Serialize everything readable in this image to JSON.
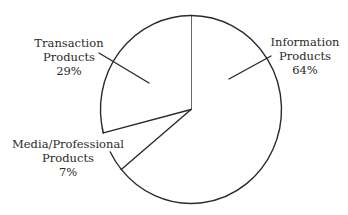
{
  "chart_data": {
    "type": "pie",
    "title": "",
    "slices": [
      {
        "name": "Information Products",
        "label_lines": [
          "Information",
          "Products",
          "64%"
        ],
        "value": 64
      },
      {
        "name": "Media/Professional Products",
        "label_lines": [
          "Media/Professional",
          "Products",
          "7%"
        ],
        "value": 7
      },
      {
        "name": "Transaction Products",
        "label_lines": [
          "Transaction",
          "Products",
          "29%"
        ],
        "value": 29
      }
    ],
    "start": "12 o'clock",
    "direction": "clockwise",
    "colors": {
      "stroke": "#2a2a2a",
      "fill": "#ffffff"
    }
  }
}
